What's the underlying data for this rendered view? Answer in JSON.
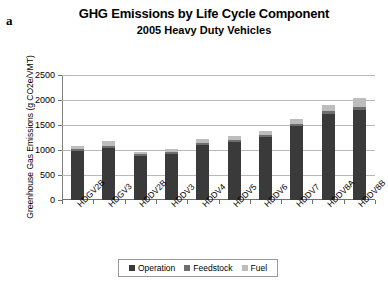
{
  "panel_letter": "a",
  "chart_data": {
    "type": "bar",
    "subtype": "stacked-bar",
    "title": "GHG Emissions by Life Cycle Component",
    "subtitle": "2005 Heavy Duty Vehicles",
    "xlabel": "",
    "ylabel": "Greenhouse Gas Emissions (g CO2e/VMT)",
    "ylim": [
      0,
      2500
    ],
    "ytick_values": [
      0,
      500,
      1000,
      1500,
      2000,
      2500
    ],
    "ytick_labels": [
      "0",
      "500",
      "1000",
      "1500",
      "2000",
      "2500"
    ],
    "grid": "horizontal",
    "legend_position": "bottom",
    "categories": [
      "HDGV2B",
      "HDGV3",
      "HDDV2B",
      "HDDV3",
      "HDDV4",
      "HDDV5",
      "HDDV6",
      "HDDV7",
      "HDDV8A",
      "HDDV8B"
    ],
    "series": [
      {
        "name": "Operation",
        "color": "#3a3a3a",
        "values": [
          980,
          1040,
          880,
          920,
          1100,
          1160,
          1260,
          1480,
          1720,
          1800
        ]
      },
      {
        "name": "Feedstock",
        "color": "#6e6e6e",
        "values": [
          40,
          45,
          35,
          35,
          40,
          40,
          40,
          50,
          60,
          70
        ]
      },
      {
        "name": "Fuel",
        "color": "#bdbdbd",
        "values": [
          60,
          95,
          45,
          65,
          80,
          80,
          80,
          90,
          120,
          170
        ]
      }
    ],
    "totals": [
      1080,
      1180,
      960,
      1020,
      1220,
      1280,
      1380,
      1620,
      1900,
      2040
    ]
  }
}
